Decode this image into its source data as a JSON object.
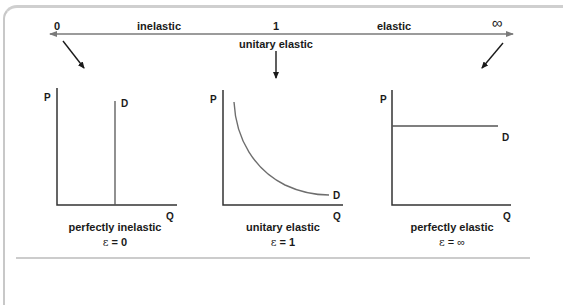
{
  "scale": {
    "left_value": "0",
    "left_label": "inelastic",
    "center_value": "1",
    "center_label": "unitary elastic",
    "right_label": "elastic",
    "right_value": "∞"
  },
  "panels": [
    {
      "id": "perfectly-inelastic",
      "y_axis": "P",
      "x_axis": "Q",
      "curve_label": "D",
      "caption": "perfectly  inelastic",
      "epsilon_symbol": "ε",
      "epsilon_value": "= 0"
    },
    {
      "id": "unitary-elastic",
      "y_axis": "P",
      "x_axis": "Q",
      "curve_label": "D",
      "caption": "unitary elastic",
      "epsilon_symbol": "ε",
      "epsilon_value": "= 1"
    },
    {
      "id": "perfectly-elastic",
      "y_axis": "P",
      "x_axis": "Q",
      "curve_label": "D",
      "caption": "perfectly elastic",
      "epsilon_symbol": "ε",
      "epsilon_value": "= ∞"
    }
  ],
  "colors": {
    "scale_arrow": "#7a7a7a",
    "axes": "#333333",
    "curve": "#6e6e6e",
    "pointer_arrows": "#1a1a1a",
    "frame": "#cccccc"
  }
}
